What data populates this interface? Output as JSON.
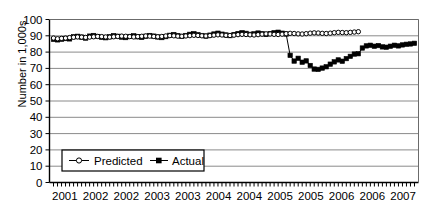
{
  "chart_data": {
    "type": "line",
    "title": "",
    "xlabel": "",
    "ylabel": "Number in 1,000s",
    "ylim": [
      0,
      100
    ],
    "ytick_step": 10,
    "yticks": [
      "0",
      "10",
      "20",
      "30",
      "40",
      "50",
      "60",
      "70",
      "80",
      "90",
      "100"
    ],
    "xticks": [
      "2001",
      "2002",
      "2002",
      "2003",
      "2003",
      "2004",
      "2004",
      "2005",
      "2005",
      "2006",
      "2006",
      "2007"
    ],
    "grid": "horizontal",
    "legend_position": "lower-left-inside",
    "series": [
      {
        "name": "Predicted",
        "marker": "open-circle",
        "color": "#000000",
        "values": [
          88.6,
          88.2,
          88.4,
          88.6,
          88.9,
          89.1,
          89.3,
          89.2,
          89.0,
          89.2,
          89.4,
          89.6,
          89.5,
          89.3,
          89.2,
          89.4,
          89.6,
          89.8,
          89.7,
          89.5,
          89.3,
          89.5,
          89.7,
          89.9,
          89.8,
          89.6,
          89.4,
          89.6,
          89.9,
          90.1,
          90.0,
          89.8,
          89.7,
          89.9,
          90.1,
          90.3,
          90.2,
          90.0,
          89.9,
          90.1,
          90.4,
          90.6,
          90.5,
          90.3,
          90.2,
          90.4,
          90.7,
          90.9,
          90.8,
          90.6,
          90.5,
          90.7,
          91.0,
          91.2,
          91.1,
          90.9,
          90.8,
          91.0,
          91.3,
          91.5,
          91.4,
          91.2,
          91.1,
          91.3,
          91.6,
          91.8,
          91.7,
          91.5,
          91.4,
          91.6,
          91.9,
          92.1,
          92.0,
          91.9,
          92.1,
          92.3,
          92.5
        ]
      },
      {
        "name": "Actual",
        "marker": "filled-square",
        "color": "#000000",
        "values": [
          87.8,
          87.5,
          87.9,
          88.3,
          88.1,
          89.4,
          89.7,
          89.2,
          88.6,
          89.8,
          90.2,
          89.6,
          89.1,
          88.8,
          89.4,
          90.1,
          89.7,
          89.2,
          88.9,
          89.6,
          90.0,
          89.4,
          89.0,
          89.7,
          90.2,
          89.8,
          89.3,
          88.9,
          89.5,
          90.3,
          90.8,
          90.1,
          89.6,
          90.2,
          90.9,
          91.3,
          90.7,
          90.2,
          89.8,
          90.4,
          91.1,
          91.6,
          91.0,
          90.5,
          90.1,
          90.8,
          91.4,
          91.9,
          91.5,
          90.9,
          91.2,
          91.7,
          91.3,
          90.8,
          91.4,
          91.9,
          92.2,
          91.6,
          91.1,
          78.0,
          74.5,
          76.2,
          73.8,
          74.6,
          71.8,
          69.6,
          69.4,
          70.2,
          71.0,
          72.6,
          74.0,
          75.2,
          74.4,
          76.0,
          77.4,
          78.8,
          79.0,
          82.5,
          83.8,
          84.2,
          83.6,
          84.0,
          83.2,
          83.0,
          83.6,
          84.2,
          83.8,
          84.4,
          84.8,
          85.0,
          85.4
        ]
      }
    ]
  },
  "legend": {
    "entries": [
      {
        "label": "Predicted",
        "marker": "open-circle"
      },
      {
        "label": "Actual",
        "marker": "filled-square"
      }
    ]
  }
}
